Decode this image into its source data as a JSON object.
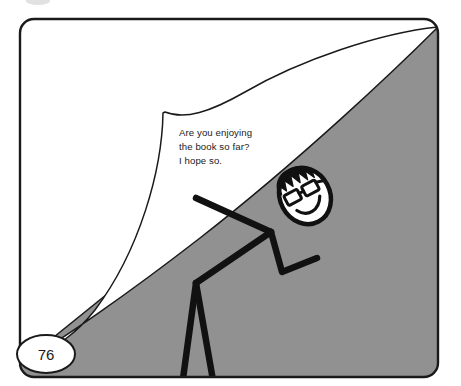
{
  "panel": {
    "name": "comic-panel",
    "width": 461,
    "height": 386,
    "border_color": "#1a1a1a",
    "background_color": "#ffffff",
    "corner_radius": 14
  },
  "scene": {
    "hill": {
      "label": "shaded-hillside",
      "fill_color": "#919191",
      "stroke_color": "#1a1a1a"
    },
    "page_curl": {
      "label": "curling-page-peel",
      "fill_color": "#ffffff",
      "stroke_color": "#1a1a1a"
    },
    "figure": {
      "label": "stick-figure-climber",
      "line_color": "#111111",
      "head_fill": "#ffffff",
      "head_outline": "#111111",
      "hair_color": "#111111",
      "glasses_color": "#111111"
    }
  },
  "speech": {
    "line1": "Are you enjoying",
    "line2": "the book so far?",
    "line3": "I hope so."
  },
  "page_marker": {
    "number": "76",
    "shape": "ellipse",
    "fill_color": "#ffffff",
    "stroke_color": "#1a1a1a"
  },
  "artifact": {
    "top_smudge_color": "#c9c9c9"
  }
}
